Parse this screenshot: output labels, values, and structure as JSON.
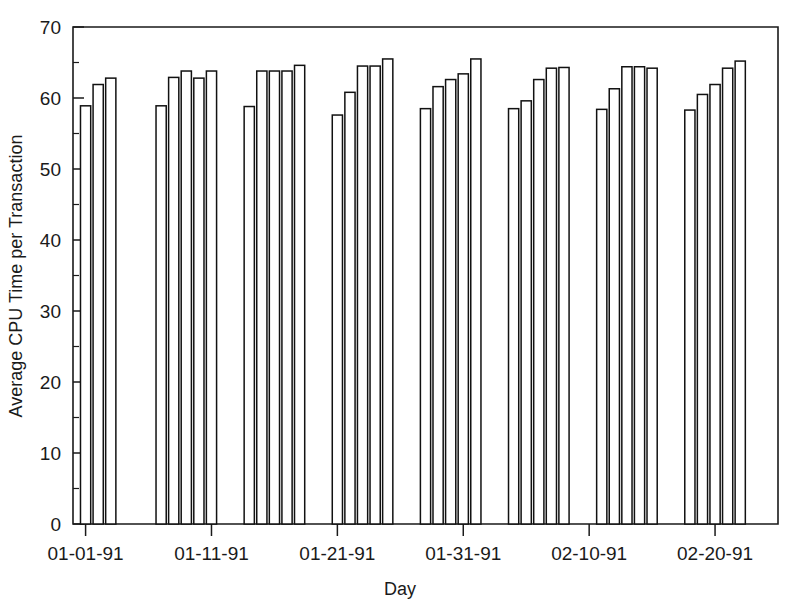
{
  "chart_data": {
    "type": "bar",
    "title": "",
    "xlabel": "Day",
    "ylabel": "Average CPU Time per Transaction",
    "ylim": [
      0,
      70
    ],
    "ytick_labels": [
      "0",
      "10",
      "20",
      "30",
      "40",
      "50",
      "60",
      "70"
    ],
    "ytick_values": [
      0,
      10,
      20,
      30,
      40,
      50,
      60,
      70
    ],
    "yminor_values": [
      5,
      15,
      25,
      35,
      45,
      55,
      65
    ],
    "xtick_labels": [
      "01-01-91",
      "01-11-91",
      "01-21-91",
      "01-31-91",
      "02-10-91",
      "02-20-91"
    ],
    "xtick_values": [
      1,
      11,
      21,
      31,
      41,
      51
    ],
    "xlim": [
      0,
      56
    ],
    "grid": false,
    "legend": false,
    "bar_fill": "#ffffff",
    "bar_edge": "#111111",
    "categories": [
      "01-01-91",
      "01-02-91",
      "01-03-91",
      "01-07-91",
      "01-08-91",
      "01-09-91",
      "01-10-91",
      "01-11-91",
      "01-14-91",
      "01-15-91",
      "01-16-91",
      "01-17-91",
      "01-18-91",
      "01-21-91",
      "01-22-91",
      "01-23-91",
      "01-24-91",
      "01-25-91",
      "01-28-91",
      "01-29-91",
      "01-30-91",
      "01-31-91",
      "02-01-91",
      "02-04-91",
      "02-05-91",
      "02-06-91",
      "02-07-91",
      "02-08-91",
      "02-11-91",
      "02-12-91",
      "02-13-91",
      "02-14-91",
      "02-15-91",
      "02-18-91",
      "02-19-91",
      "02-20-91",
      "02-21-91",
      "02-22-91"
    ],
    "values": [
      58.9,
      61.9,
      62.8,
      58.9,
      62.9,
      63.8,
      62.8,
      63.8,
      58.8,
      63.8,
      63.8,
      63.8,
      64.6,
      57.6,
      60.8,
      64.5,
      64.5,
      65.5,
      58.5,
      61.6,
      62.6,
      63.4,
      65.5,
      58.5,
      59.6,
      62.6,
      64.2,
      64.3,
      58.4,
      61.3,
      64.4,
      64.4,
      64.2,
      58.3,
      60.5,
      61.9,
      64.2,
      65.2
    ],
    "x_positions": [
      1.0,
      2.0,
      3.0,
      7.0,
      8.0,
      9.0,
      10.0,
      11.0,
      14.0,
      15.0,
      16.0,
      17.0,
      18.0,
      21.0,
      22.0,
      23.0,
      24.0,
      25.0,
      28.0,
      29.0,
      30.0,
      31.0,
      32.0,
      35.0,
      36.0,
      37.0,
      38.0,
      39.0,
      42.0,
      43.0,
      44.0,
      45.0,
      46.0,
      49.0,
      50.0,
      51.0,
      52.0,
      53.0
    ],
    "groups": [
      {
        "label": "week-1",
        "count": 3
      },
      {
        "label": "week-2",
        "count": 5
      },
      {
        "label": "week-3",
        "count": 5
      },
      {
        "label": "week-4",
        "count": 5
      },
      {
        "label": "week-5",
        "count": 5
      },
      {
        "label": "week-6",
        "count": 5
      },
      {
        "label": "week-7",
        "count": 5
      },
      {
        "label": "week-8",
        "count": 5
      }
    ]
  }
}
